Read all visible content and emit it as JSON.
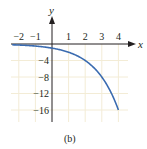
{
  "chart_data": {
    "type": "line",
    "title": "",
    "caption": "(b)",
    "xlabel": "x",
    "ylabel": "y",
    "xlim": [
      -2.5,
      4.6
    ],
    "ylim": [
      -17,
      0
    ],
    "grid": true,
    "legend": null,
    "x_ticks": [
      -2,
      -1,
      1,
      2,
      3,
      4
    ],
    "x_tick_labels": [
      "−2",
      "−1",
      "1",
      "2",
      "3",
      "4"
    ],
    "y_ticks": [
      -4,
      -8,
      -12,
      -16
    ],
    "y_tick_labels": [
      "−4",
      "−8",
      "−12",
      "−16"
    ],
    "series": [
      {
        "name": "y = -2^x",
        "color": "#3a6bb0",
        "x": [
          -2.4,
          -2,
          -1,
          0,
          1,
          2,
          3,
          3.5,
          4
        ],
        "y": [
          -0.19,
          -0.25,
          -0.5,
          -1,
          -2,
          -4,
          -8,
          -11.3,
          -16
        ]
      }
    ]
  },
  "colors": {
    "grid": "#f3ecd6",
    "axis": "#231f20",
    "curve": "#3a6bb0"
  }
}
